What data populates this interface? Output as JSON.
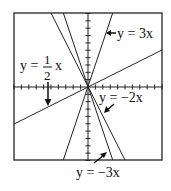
{
  "figure": {
    "window": {
      "xmin": -10,
      "xmax": 10,
      "ymin": -10,
      "ymax": 10,
      "tick_spacing": 1
    },
    "lines": [
      {
        "equation": "y = 3x",
        "slope": 3
      },
      {
        "equation": "y = 1/2 x",
        "slope": 0.5
      },
      {
        "equation": "y = -2x",
        "slope": -2
      },
      {
        "equation": "y = -3x",
        "slope": -3
      }
    ],
    "labels": {
      "y3x": "y = 3x",
      "yhalf_prefix": "y =",
      "yhalf_num": "1",
      "yhalf_den": "2",
      "yhalf_suffix": "x",
      "yneg2x": "y = −2x",
      "yneg3x": "y = −3x"
    }
  }
}
